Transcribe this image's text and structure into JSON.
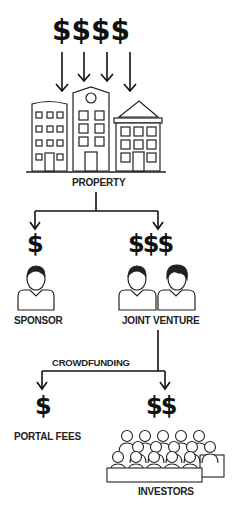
{
  "diagram": {
    "top_money": "$$$$",
    "nodes": {
      "property": {
        "label": "PROPERTY"
      },
      "sponsor": {
        "label": "SPONSOR",
        "money": "$"
      },
      "joint_venture": {
        "label": "JOINT VENTURE",
        "money": "$$$"
      },
      "portal_fees": {
        "label": "PORTAL FEES",
        "money": "$"
      },
      "investors": {
        "label": "INVESTORS",
        "money": "$$"
      }
    },
    "edges": [
      {
        "from": "money",
        "to": "property"
      },
      {
        "from": "property",
        "to": "sponsor"
      },
      {
        "from": "property",
        "to": "joint_venture"
      },
      {
        "from": "joint_venture",
        "to": "portal_fees",
        "label": "CROWDFUNDING"
      },
      {
        "from": "joint_venture",
        "to": "investors",
        "label": "CROWDFUNDING"
      }
    ],
    "edge_label": "CROWDFUNDING",
    "colors": {
      "ink": "#111111",
      "background": "#ffffff"
    }
  }
}
